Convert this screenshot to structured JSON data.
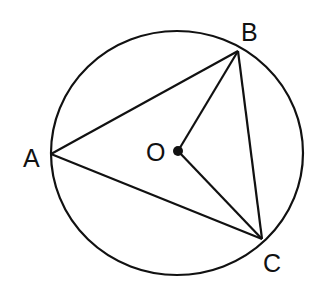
{
  "diagram": {
    "type": "circle-inscribed-triangle",
    "circle": {
      "center_label": "O",
      "cx": 177,
      "cy": 152,
      "rx": 126,
      "ry": 122
    },
    "points": {
      "A": {
        "label": "A",
        "x": 51,
        "y": 154
      },
      "B": {
        "label": "B",
        "x": 238,
        "y": 51
      },
      "C": {
        "label": "C",
        "x": 262,
        "y": 239
      },
      "O": {
        "label": "O",
        "x": 178,
        "y": 151
      }
    },
    "segments": [
      "AB",
      "BC",
      "CA",
      "OB",
      "OC"
    ],
    "stroke_color": "#111111"
  }
}
